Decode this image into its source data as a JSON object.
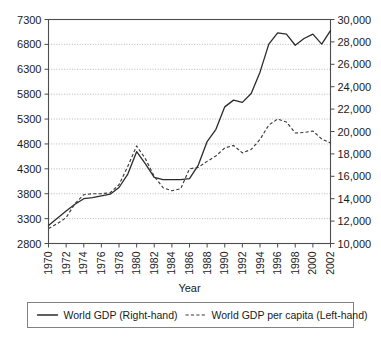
{
  "chart_data": {
    "type": "line",
    "title": "",
    "xlabel": "Year",
    "ylabel": "",
    "x": [
      1970,
      1971,
      1972,
      1973,
      1974,
      1975,
      1976,
      1977,
      1978,
      1979,
      1980,
      1981,
      1982,
      1983,
      1984,
      1985,
      1986,
      1987,
      1988,
      1989,
      1990,
      1991,
      1992,
      1993,
      1994,
      1995,
      1996,
      1997,
      1998,
      1999,
      2000,
      2001,
      2002
    ],
    "xlim": [
      1970,
      2002
    ],
    "xticks": [
      1970,
      1972,
      1974,
      1976,
      1978,
      1980,
      1982,
      1984,
      1986,
      1988,
      1990,
      1992,
      1994,
      1996,
      1998,
      2000,
      2002
    ],
    "xtick_labels": [
      "1970",
      "1972",
      "1974",
      "1976",
      "1978",
      "1980",
      "1982",
      "1984",
      "1986",
      "1988",
      "1990",
      "1992",
      "1994",
      "1996",
      "1998",
      "2000",
      "2002"
    ],
    "grid": true,
    "legend_position": "below-outside",
    "left_axis": {
      "name": "left",
      "ylim": [
        2800,
        7300
      ],
      "yticks": [
        2800,
        3300,
        3800,
        4300,
        4800,
        5300,
        5800,
        6300,
        6800,
        7300
      ],
      "ytick_labels": [
        "2800",
        "3300",
        "3800",
        "4300",
        "4800",
        "5300",
        "5800",
        "6300",
        "6800",
        "7300"
      ]
    },
    "right_axis": {
      "name": "right",
      "ylim": [
        10000,
        30000
      ],
      "yticks": [
        10000,
        12000,
        14000,
        16000,
        18000,
        20000,
        22000,
        24000,
        26000,
        28000,
        30000
      ],
      "ytick_labels": [
        "10,000",
        "12,000",
        "14,000",
        "16,000",
        "18,000",
        "20,000",
        "22,000",
        "24,000",
        "26,000",
        "28,000",
        "30,000"
      ]
    },
    "series": [
      {
        "name": "World GDP (Right-hand)",
        "axis": "right",
        "style": "solid",
        "color": "#2b2b2b",
        "values": [
          11600,
          12250,
          12900,
          13500,
          14000,
          14100,
          14250,
          14400,
          15000,
          16200,
          18200,
          17100,
          15900,
          15700,
          15700,
          15700,
          15800,
          17000,
          19100,
          20200,
          22200,
          22800,
          22600,
          23400,
          25300,
          27800,
          28800,
          28700,
          27700,
          28300,
          28700,
          27800,
          29000
        ]
      },
      {
        "name": "World GDP per capita (Left-hand)",
        "axis": "left",
        "style": "dashed",
        "color": "#3a3a3a",
        "values": [
          3100,
          3200,
          3320,
          3600,
          3780,
          3800,
          3800,
          3820,
          3980,
          4350,
          4760,
          4500,
          4150,
          3920,
          3860,
          3900,
          4300,
          4330,
          4450,
          4560,
          4720,
          4770,
          4620,
          4690,
          4890,
          5180,
          5300,
          5240,
          5020,
          5030,
          5060,
          4900,
          4820
        ]
      }
    ],
    "legend": [
      {
        "label": "World GDP (Right-hand)",
        "style": "solid"
      },
      {
        "label": "World GDP per capita (Left-hand)",
        "style": "dashed"
      }
    ]
  }
}
